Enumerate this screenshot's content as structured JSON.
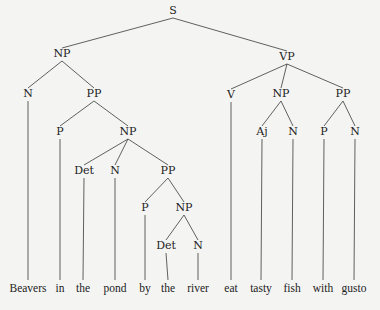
{
  "diagram": {
    "type": "syntax-tree",
    "sentence": "Beavers in the pond by the river eat tasty fish with gusto",
    "nodes": [
      {
        "id": "s",
        "label": "S",
        "x": 173,
        "y": 14
      },
      {
        "id": "np1",
        "label": "NP",
        "x": 62,
        "y": 57,
        "parent": "s"
      },
      {
        "id": "vp",
        "label": "VP",
        "x": 287,
        "y": 60,
        "parent": "s"
      },
      {
        "id": "n1",
        "label": "N",
        "x": 28,
        "y": 97,
        "parent": "np1"
      },
      {
        "id": "pp1",
        "label": "PP",
        "x": 94,
        "y": 97,
        "parent": "np1"
      },
      {
        "id": "v",
        "label": "V",
        "x": 231,
        "y": 98,
        "parent": "vp"
      },
      {
        "id": "np4",
        "label": "NP",
        "x": 281,
        "y": 97,
        "parent": "vp"
      },
      {
        "id": "pp3",
        "label": "PP",
        "x": 343,
        "y": 97,
        "parent": "vp"
      },
      {
        "id": "p1",
        "label": "P",
        "x": 60,
        "y": 135,
        "parent": "pp1"
      },
      {
        "id": "np2",
        "label": "NP",
        "x": 128,
        "y": 135,
        "parent": "pp1"
      },
      {
        "id": "aj",
        "label": "Aj",
        "x": 262,
        "y": 135,
        "parent": "np4"
      },
      {
        "id": "n4",
        "label": "N",
        "x": 293,
        "y": 135,
        "parent": "np4"
      },
      {
        "id": "p3",
        "label": "P",
        "x": 324,
        "y": 135,
        "parent": "pp3"
      },
      {
        "id": "n5",
        "label": "N",
        "x": 355,
        "y": 135,
        "parent": "pp3"
      },
      {
        "id": "det1",
        "label": "Det",
        "x": 84,
        "y": 174,
        "parent": "np2"
      },
      {
        "id": "n2",
        "label": "N",
        "x": 115,
        "y": 174,
        "parent": "np2"
      },
      {
        "id": "pp2",
        "label": "PP",
        "x": 168,
        "y": 174,
        "parent": "np2"
      },
      {
        "id": "p2",
        "label": "P",
        "x": 145,
        "y": 211,
        "parent": "pp2"
      },
      {
        "id": "np3",
        "label": "NP",
        "x": 184,
        "y": 211,
        "parent": "pp2"
      },
      {
        "id": "det2",
        "label": "Det",
        "x": 166,
        "y": 249,
        "parent": "np3"
      },
      {
        "id": "n3",
        "label": "N",
        "x": 198,
        "y": 249,
        "parent": "np3"
      }
    ],
    "leaves": [
      {
        "word": "Beavers",
        "x": 28,
        "parent": "n1"
      },
      {
        "word": "in",
        "x": 60,
        "parent": "p1"
      },
      {
        "word": "the",
        "x": 83,
        "parent": "det1"
      },
      {
        "word": "pond",
        "x": 115,
        "parent": "n2"
      },
      {
        "word": "by",
        "x": 145,
        "parent": "p2"
      },
      {
        "word": "the",
        "x": 168,
        "parent": "det2"
      },
      {
        "word": "river",
        "x": 198,
        "parent": "n3"
      },
      {
        "word": "eat",
        "x": 231,
        "parent": "v"
      },
      {
        "word": "tasty",
        "x": 261,
        "parent": "aj"
      },
      {
        "word": "fish",
        "x": 292,
        "parent": "n4"
      },
      {
        "word": "with",
        "x": 323,
        "parent": "p3"
      },
      {
        "word": "gusto",
        "x": 354,
        "parent": "n5"
      }
    ],
    "leaf_y": 292,
    "colors": {
      "background": "#f4f4f2",
      "ink": "#222222"
    }
  }
}
